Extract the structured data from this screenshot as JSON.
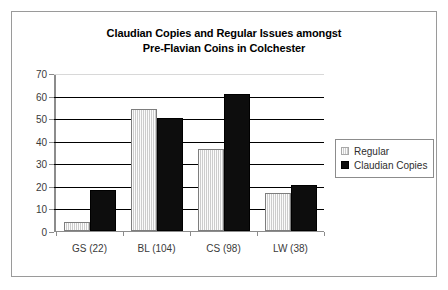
{
  "chart_data": {
    "type": "bar",
    "title": "Claudian Copies and Regular Issues amongst Pre-Flavian Coins in Colchester",
    "title_lines": [
      "Claudian Copies and Regular Issues amongst",
      "Pre-Flavian Coins in Colchester"
    ],
    "categories": [
      "GS (22)",
      "BL (104)",
      "CS (98)",
      "LW (38)"
    ],
    "series": [
      {
        "name": "Regular",
        "color": "#e3e3e3",
        "values": [
          4,
          54,
          36.5,
          17
        ]
      },
      {
        "name": "Claudian Copies",
        "color": "#0d0d0d",
        "values": [
          18,
          50,
          60.5,
          20.5
        ]
      }
    ],
    "xlabel": "",
    "ylabel": "",
    "ylim": [
      0,
      70
    ],
    "ytick_values": [
      0,
      10,
      20,
      30,
      40,
      50,
      60,
      70
    ],
    "ytick_labels": [
      "0",
      "10",
      "20",
      "30",
      "40",
      "50",
      "60",
      "70"
    ],
    "grid": true,
    "grid_orientation": "horizontal",
    "legend_position": "right"
  },
  "legend": {
    "items": [
      {
        "label": "Regular",
        "swatch": "regular-swatch"
      },
      {
        "label": "Claudian Copies",
        "swatch": "claudian-copies-swatch"
      }
    ]
  },
  "colors": {
    "regular_bar": "#e3e3e3",
    "claudian_bar": "#0d0d0d",
    "gridline": "#000000",
    "axis": "#8c8c8c",
    "frame_border": "#9a9a9a",
    "text": "#3a3a3a",
    "title_text": "#000000",
    "background": "#ffffff"
  }
}
